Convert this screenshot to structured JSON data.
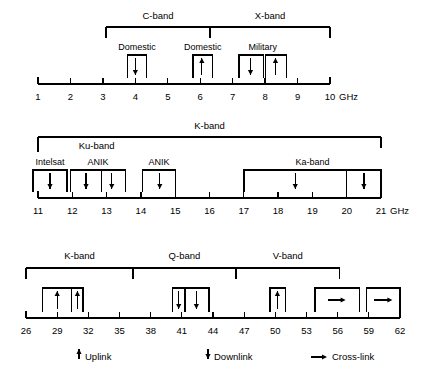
{
  "figure": {
    "unit_label": "GHz",
    "line_color": "#000000",
    "background_color": "#ffffff"
  },
  "chart_data": {
    "type": "table",
    "xlabel": "Frequency (GHz)",
    "ylabel": "",
    "grid": false,
    "legend_position": "bottom",
    "axes": [
      {
        "id": "axis-1",
        "xlim": [
          1,
          10
        ],
        "tick_step": 1,
        "ticks": [
          1,
          2,
          3,
          4,
          5,
          6,
          7,
          8,
          9,
          10
        ],
        "tick_labels": [
          "1",
          "2",
          "3",
          "4",
          "5",
          "6",
          "7",
          "8",
          "9",
          "10"
        ],
        "unit_label": "GHz",
        "bands": [
          {
            "label": "C-band",
            "start": 3.1,
            "end": 6.3
          },
          {
            "label": "X-band",
            "start": 6.3,
            "end": 10.0
          }
        ],
        "systems": [
          {
            "label": "Domestic",
            "start": 3.75,
            "end": 4.35,
            "cells": [
              {
                "start": 3.75,
                "end": 4.35,
                "marker": "downlink",
                "marker_x": 4.0
              }
            ]
          },
          {
            "label": "Domestic",
            "start": 5.78,
            "end": 6.38,
            "cells": [
              {
                "start": 5.78,
                "end": 6.38,
                "marker": "uplink",
                "marker_x": 6.05
              }
            ]
          },
          {
            "label": "Military",
            "start": 7.2,
            "end": 8.65,
            "cells": [
              {
                "start": 7.2,
                "end": 7.95,
                "marker": "downlink",
                "marker_x": 7.55
              },
              {
                "start": 8.02,
                "end": 8.65,
                "marker": "uplink",
                "marker_x": 8.32
              }
            ]
          }
        ]
      },
      {
        "id": "axis-2",
        "xlim": [
          11,
          21
        ],
        "tick_step": 1,
        "ticks": [
          11,
          12,
          13,
          14,
          15,
          16,
          17,
          18,
          19,
          20,
          21
        ],
        "tick_labels": [
          "11",
          "12",
          "13",
          "14",
          "15",
          "16",
          "17",
          "18",
          "19",
          "20",
          "21"
        ],
        "unit_label": "GHz",
        "bands": [
          {
            "label": "K-band",
            "start": 11.0,
            "end": 21.0
          }
        ],
        "sub_bands": [
          {
            "label": "Ku-band",
            "start": 11.0,
            "end": 15.0
          }
        ],
        "systems": [
          {
            "label": "Intelsat",
            "start": 10.85,
            "end": 11.85,
            "cells": [
              {
                "start": 10.85,
                "end": 11.85,
                "marker": "downlink",
                "marker_x": 11.35
              }
            ]
          },
          {
            "label": "ANIK",
            "start": 11.95,
            "end": 13.55,
            "cells": [
              {
                "start": 11.95,
                "end": 12.85,
                "marker": "downlink",
                "marker_x": 12.4
              },
              {
                "start": 12.85,
                "end": 13.55,
                "marker": "downlink",
                "marker_x": 13.15
              }
            ]
          },
          {
            "label": "ANIK",
            "start": 14.05,
            "end": 15.0,
            "cells": [
              {
                "start": 14.05,
                "end": 15.0,
                "marker": "downlink",
                "marker_x": 14.55
              }
            ]
          },
          {
            "label": "Ka-band",
            "start": 17.0,
            "end": 21.0,
            "cells": [
              {
                "start": 17.0,
                "end": 20.0,
                "marker": "downlink",
                "marker_x": 18.5
              },
              {
                "start": 20.0,
                "end": 21.0,
                "marker": "downlink",
                "marker_x": 20.5
              }
            ]
          }
        ]
      },
      {
        "id": "axis-3",
        "xlim": [
          26,
          62
        ],
        "tick_step": 3,
        "ticks": [
          26,
          29,
          32,
          35,
          38,
          41,
          44,
          47,
          50,
          53,
          56,
          59,
          62
        ],
        "tick_labels": [
          "26",
          "29",
          "32",
          "35",
          "38",
          "41",
          "44",
          "47",
          "50",
          "53",
          "56",
          "59",
          "62"
        ],
        "unit_label": "",
        "bands": [
          {
            "label": "K-band",
            "start": 26.0,
            "end": 36.3
          },
          {
            "label": "Q-band",
            "start": 36.3,
            "end": 46.2
          },
          {
            "label": "V-band",
            "start": 46.2,
            "end": 56.2
          }
        ],
        "systems": [
          {
            "label": "",
            "start": 27.6,
            "end": 31.5,
            "cells": [
              {
                "start": 27.6,
                "end": 30.4,
                "marker": "uplink",
                "marker_x": 29.0
              },
              {
                "start": 30.4,
                "end": 31.5,
                "marker": "uplink",
                "marker_x": 30.95
              }
            ]
          },
          {
            "label": "",
            "start": 40.1,
            "end": 43.6,
            "cells": [
              {
                "start": 40.1,
                "end": 41.3,
                "marker": "downlink",
                "marker_x": 40.7
              },
              {
                "start": 41.3,
                "end": 43.6,
                "marker": "downlink",
                "marker_x": 42.4
              }
            ]
          },
          {
            "label": "",
            "start": 49.5,
            "end": 51.0,
            "cells": [
              {
                "start": 49.5,
                "end": 51.0,
                "marker": "uplink",
                "marker_x": 50.2
              }
            ]
          },
          {
            "label": "",
            "start": 53.8,
            "end": 58.1,
            "cells": [
              {
                "start": 53.8,
                "end": 58.1,
                "marker": "crosslink",
                "marker_x": 55.9
              }
            ]
          },
          {
            "label": "",
            "start": 58.8,
            "end": 62.0,
            "cells": [
              {
                "start": 58.8,
                "end": 62.0,
                "marker": "crosslink",
                "marker_x": 60.4
              }
            ]
          }
        ]
      }
    ]
  },
  "legend": {
    "items": [
      {
        "symbol": "uplink",
        "label": "Uplink"
      },
      {
        "symbol": "downlink",
        "label": "Downlink"
      },
      {
        "symbol": "crosslink",
        "label": "Cross-link"
      }
    ]
  }
}
